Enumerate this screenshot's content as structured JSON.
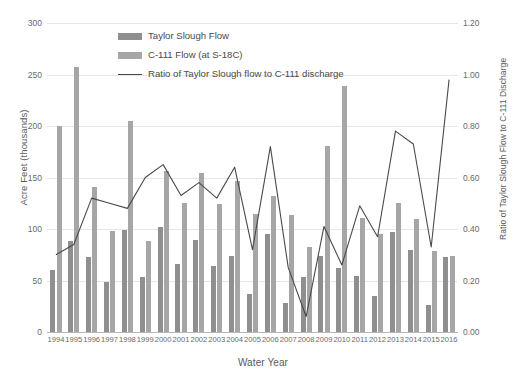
{
  "chart_data": {
    "type": "bar",
    "title": "",
    "xlabel": "Water Year",
    "ylabel": "Acre Feet (thousands)",
    "y2label": "Ratio of Taylor Slough Flow to C-111 Discharge",
    "categories": [
      "1994",
      "1995",
      "1996",
      "1997",
      "1998",
      "1999",
      "2000",
      "2001",
      "2002",
      "2003",
      "2004",
      "2005",
      "2006",
      "2007",
      "2008",
      "2009",
      "2010",
      "2011",
      "2012",
      "2013",
      "2014",
      "2015",
      "2016"
    ],
    "ylim": [
      0,
      300
    ],
    "yticks": [
      "0",
      "50",
      "100",
      "150",
      "200",
      "250",
      "300"
    ],
    "y2lim": [
      0,
      1.2
    ],
    "y2ticks": [
      "0.00",
      "0.20",
      "0.40",
      "0.60",
      "0.80",
      "1.00",
      "1.20"
    ],
    "grid": true,
    "legend_position": "top-center",
    "series": [
      {
        "name": "Taylor Slough Flow",
        "kind": "bar",
        "color": "#8f8f8f",
        "axis": "left",
        "values": [
          60,
          88,
          73,
          49,
          99,
          53,
          102,
          66,
          89,
          64,
          74,
          37,
          95,
          28,
          53,
          74,
          62,
          54,
          35,
          97,
          80,
          26,
          73
        ]
      },
      {
        "name": "C-111 Flow (at S-18C)",
        "kind": "bar",
        "color": "#a6a6a6",
        "axis": "left",
        "values": [
          200,
          257,
          141,
          98,
          205,
          88,
          156,
          125,
          154,
          124,
          147,
          115,
          132,
          114,
          83,
          181,
          239,
          111,
          95,
          125,
          110,
          79,
          74
        ]
      },
      {
        "name": "Ratio of Taylor Slough flow to C-111 discharge",
        "kind": "line",
        "color": "#4a4a4a",
        "axis": "right",
        "values": [
          0.3,
          0.34,
          0.52,
          0.5,
          0.48,
          0.6,
          0.65,
          0.53,
          0.58,
          0.52,
          0.64,
          0.32,
          0.72,
          0.25,
          0.06,
          0.41,
          0.26,
          0.49,
          0.37,
          0.78,
          0.73,
          0.33,
          0.98
        ]
      }
    ]
  },
  "legend": {
    "items": [
      {
        "label": "Taylor Slough Flow",
        "marker": "swatch",
        "color": "#8f8f8f"
      },
      {
        "label": "C-111 Flow (at S-18C)",
        "marker": "swatch",
        "color": "#a6a6a6"
      },
      {
        "label": "Ratio of Taylor Slough flow to C-111 discharge",
        "marker": "line",
        "color": "#4a4a4a"
      }
    ]
  }
}
